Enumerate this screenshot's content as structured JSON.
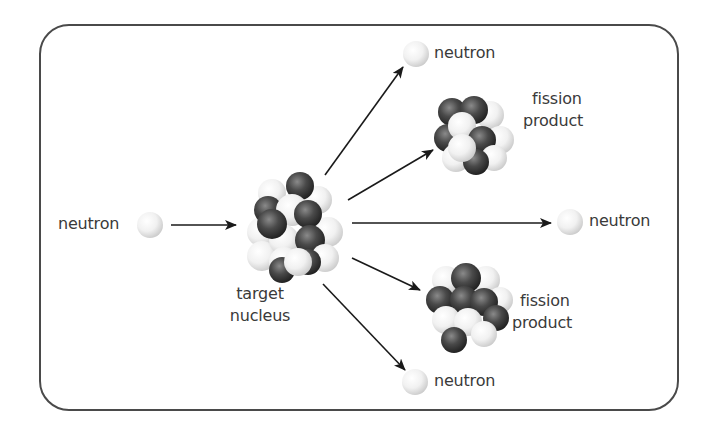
{
  "diagram": {
    "labels": {
      "incoming_neutron": "neutron",
      "target_nucleus_line1": "target",
      "target_nucleus_line2": "nucleus",
      "neutron_top": "neutron",
      "neutron_right": "neutron",
      "neutron_bottom": "neutron",
      "fission_product_top_line1": "fission",
      "fission_product_top_line2": "product",
      "fission_product_bottom_line1": "fission",
      "fission_product_bottom_line2": "product"
    },
    "colors": {
      "frame": "#4a4a4a",
      "arrow": "#1a1a1a",
      "text": "#3a3a3a",
      "neutron_light": "#f4f4f4",
      "proton_dark": "#3c3c3c"
    },
    "nodes": [
      {
        "id": "incoming-neutron",
        "type": "neutron",
        "label": "neutron"
      },
      {
        "id": "target-nucleus",
        "type": "nucleus",
        "label": "target nucleus"
      },
      {
        "id": "neutron-top",
        "type": "neutron",
        "label": "neutron"
      },
      {
        "id": "fission-product-top",
        "type": "nucleus",
        "label": "fission product"
      },
      {
        "id": "neutron-right",
        "type": "neutron",
        "label": "neutron"
      },
      {
        "id": "fission-product-bottom",
        "type": "nucleus",
        "label": "fission product"
      },
      {
        "id": "neutron-bottom",
        "type": "neutron",
        "label": "neutron"
      }
    ],
    "edges": [
      {
        "from": "incoming-neutron",
        "to": "target-nucleus"
      },
      {
        "from": "target-nucleus",
        "to": "neutron-top"
      },
      {
        "from": "target-nucleus",
        "to": "fission-product-top"
      },
      {
        "from": "target-nucleus",
        "to": "neutron-right"
      },
      {
        "from": "target-nucleus",
        "to": "fission-product-bottom"
      },
      {
        "from": "target-nucleus",
        "to": "neutron-bottom"
      }
    ]
  }
}
